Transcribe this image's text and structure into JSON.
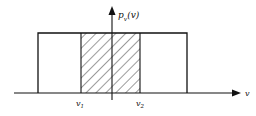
{
  "diagram": {
    "type": "uniform probability density",
    "y_axis_label": {
      "main": "p",
      "sub": "v",
      "arg": "(v)"
    },
    "x_axis_label": "v",
    "markers": [
      {
        "main": "v",
        "sub": "1"
      },
      {
        "main": "v",
        "sub": "2"
      }
    ],
    "shaded_region": "between v1 and v2",
    "colors": {
      "line": "#111111",
      "background": "#ffffff"
    }
  }
}
